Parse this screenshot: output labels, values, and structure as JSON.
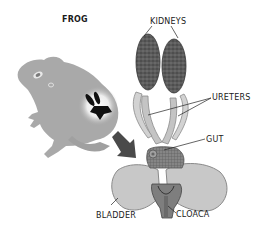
{
  "diagram": {
    "title": "FROG",
    "labels": {
      "kidneys": "KIDNEYS",
      "ureters": "URETERS",
      "gut": "GUT",
      "bladder": "BLADDER",
      "cloaca": "CLOACA"
    },
    "colors": {
      "frog_body": "#a9a9a9",
      "frog_highlight": "#ffffff",
      "kidney": "#5a5a5a",
      "kidney_speckle": "#3a3a3a",
      "ureter": "#bdbdbd",
      "bladder": "#c8c8c8",
      "bladder_outline": "#8a8a8a",
      "gut": "#7a7a7a",
      "arrow": "#4a4a4a",
      "organ_silhouette": "#111111",
      "text": "#1a1a1a"
    }
  }
}
